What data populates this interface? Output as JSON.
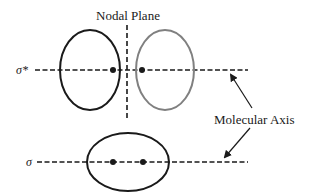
{
  "diagram": {
    "title": "Nodal Plane",
    "axis_label": "Molecular Axis",
    "antibonding": {
      "label": "σ*",
      "left_lobe_color": "#1a1a1a",
      "right_lobe_color": "#808080"
    },
    "bonding": {
      "label": "σ",
      "lobe_color": "#1a1a1a"
    },
    "colors": {
      "line": "#1a1a1a",
      "secondary_lobe": "#808080",
      "background": "#ffffff"
    }
  }
}
